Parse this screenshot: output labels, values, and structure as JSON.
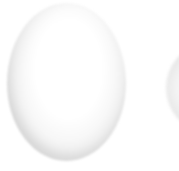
{
  "scene": {
    "description": "Two white eggs photographed on a plain white background; the left egg is fully visible, the right egg is cut off by the image edge leaving only a thin gray sliver.",
    "objects": [
      {
        "name": "egg-main",
        "shape": "oval",
        "position": "center-left",
        "label": ""
      },
      {
        "name": "egg-partial-right",
        "shape": "oval sliver",
        "position": "right-edge",
        "label": ""
      }
    ],
    "colors": {
      "background": "#ffffff",
      "egg_highlight": "#ffffff",
      "egg_mid": "#f4f4f4",
      "egg_edge": "#e2e2e2",
      "egg_shadow": "#d3d3d3",
      "egg_shadow_dark": "#cacaca"
    }
  }
}
